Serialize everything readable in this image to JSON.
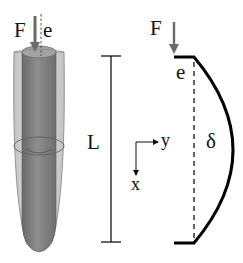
{
  "diagram": {
    "type": "eccentric column buckling",
    "left_figure": {
      "description": "3D cylindrical column with transparent outer shell and inner rod",
      "labels": {
        "force": "F",
        "eccentricity": "e"
      }
    },
    "right_figure": {
      "description": "2D deflected column schematic",
      "labels": {
        "force": "F",
        "eccentricity": "e",
        "length": "L",
        "deflection": "δ",
        "axis_x": "x",
        "axis_y": "y"
      }
    },
    "colors": {
      "shell_fill": "#d4d4d4",
      "shell_edge": "#8a8a8a",
      "rod_fill": "#7d7d7d",
      "rod_top": "#a6a6a6",
      "arrow": "#6b6b6b",
      "line": "#000000"
    }
  }
}
